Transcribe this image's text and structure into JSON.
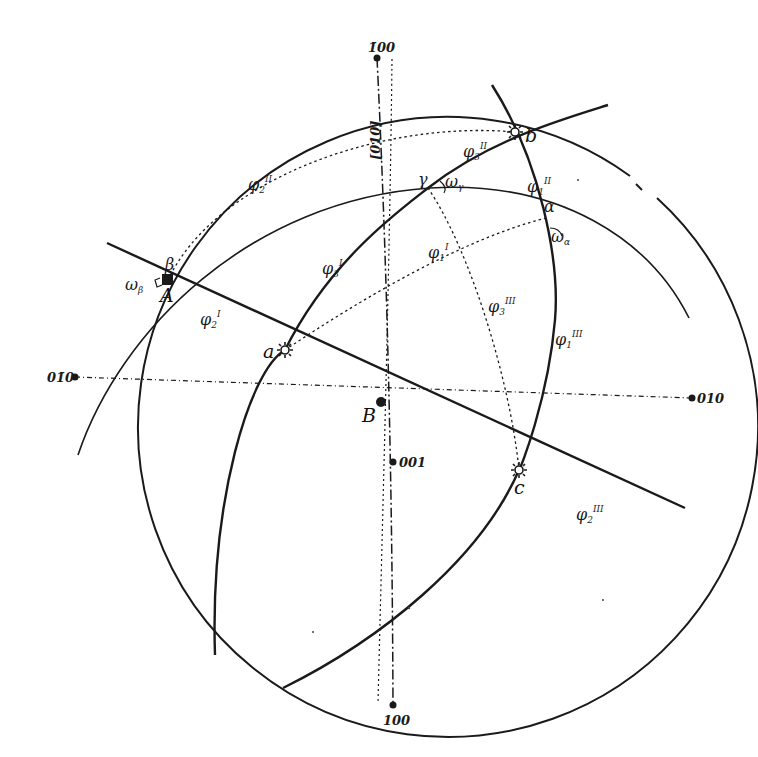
{
  "diagram": {
    "type": "stereographic-projection",
    "primitive_circle": {
      "cx": 383,
      "cy": 397,
      "r": 310
    },
    "colors": {
      "ink": "#1a1a1a",
      "background": "#ffffff"
    },
    "poles": {
      "top": "1̄00",
      "bottom": "100",
      "left": "01̄0",
      "right": "010",
      "center": "001",
      "zone_axis": "[010]"
    },
    "points": {
      "A": "A",
      "B": "B",
      "a": "a",
      "b": "b",
      "c": "c",
      "alpha": "α",
      "beta": "β",
      "gamma": "γ"
    },
    "angles": {
      "omega_beta": {
        "base": "ω",
        "sub": "β"
      },
      "omega_gamma": {
        "base": "ω",
        "sub": "γ"
      },
      "omega_alpha": {
        "base": "ω",
        "sub": "α"
      },
      "phi1_prime": {
        "base": "φ",
        "sub": "1",
        "sup": "I"
      },
      "phi2_prime": {
        "base": "φ",
        "sub": "2",
        "sup": "I"
      },
      "phi3_prime": {
        "base": "φ",
        "sub": "3",
        "sup": "I"
      },
      "phi1_dprime": {
        "base": "φ",
        "sub": "1",
        "sup": "II"
      },
      "phi2_dprime": {
        "base": "φ",
        "sub": "2",
        "sup": "II"
      },
      "phi3_dprime": {
        "base": "φ",
        "sub": "3",
        "sup": "II"
      },
      "phi1_tprime": {
        "base": "φ",
        "sub": "1",
        "sup": "III"
      },
      "phi2_tprime": {
        "base": "φ",
        "sub": "2",
        "sup": "III"
      },
      "phi3_tprime": {
        "base": "φ",
        "sub": "3",
        "sup": "III"
      }
    }
  }
}
